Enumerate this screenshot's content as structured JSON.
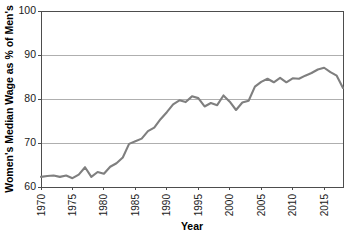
{
  "chart_data": {
    "type": "line",
    "title": "",
    "xlabel": "Year",
    "ylabel": "Women's Median Wage as % of Men's",
    "xlim": [
      1970,
      2018
    ],
    "ylim": [
      60,
      100
    ],
    "grid": true,
    "legend": "none",
    "xticks": [
      1970,
      1975,
      1980,
      1985,
      1990,
      1995,
      2000,
      2005,
      2010,
      2015
    ],
    "yticks": [
      60,
      70,
      80,
      90,
      100
    ],
    "xtick_labels": [
      "1970",
      "1975",
      "1980",
      "1985",
      "1990",
      "1995",
      "2000",
      "2005",
      "2010",
      "2015"
    ],
    "ytick_labels": [
      "60",
      "70",
      "80",
      "90",
      "100"
    ],
    "xtick_rotation": 90,
    "series": [
      {
        "name": "Women's Median Wage as % of Men's",
        "color": "#7f7f7f",
        "x": [
          1970,
          1971,
          1972,
          1973,
          1974,
          1975,
          1976,
          1977,
          1978,
          1979,
          1980,
          1981,
          1982,
          1983,
          1984,
          1985,
          1986,
          1987,
          1988,
          1989,
          1990,
          1991,
          1992,
          1993,
          1994,
          1995,
          1996,
          1997,
          1998,
          1999,
          2000,
          2001,
          2002,
          2003,
          2004,
          2005,
          2006,
          2007,
          2008,
          2009,
          2010,
          2011,
          2012,
          2013,
          2014,
          2015,
          2016,
          2017,
          2018
        ],
        "values": [
          62.3,
          62.5,
          62.6,
          62.3,
          62.6,
          62.0,
          62.8,
          64.5,
          62.3,
          63.4,
          63.0,
          64.6,
          65.4,
          66.7,
          69.8,
          70.4,
          71.0,
          72.7,
          73.5,
          75.4,
          77.0,
          78.8,
          79.7,
          79.3,
          80.6,
          80.2,
          78.3,
          79.1,
          78.6,
          80.8,
          79.4,
          77.5,
          79.2,
          79.6,
          82.8,
          83.9,
          84.6,
          83.8,
          84.8,
          83.8,
          84.7,
          84.6,
          85.3,
          85.9,
          86.7,
          87.1,
          86.1,
          85.3,
          82.5
        ]
      }
    ]
  },
  "axes": {
    "y_axis_title": "Women's Median Wage as % of Men's",
    "x_axis_title": "Year"
  }
}
